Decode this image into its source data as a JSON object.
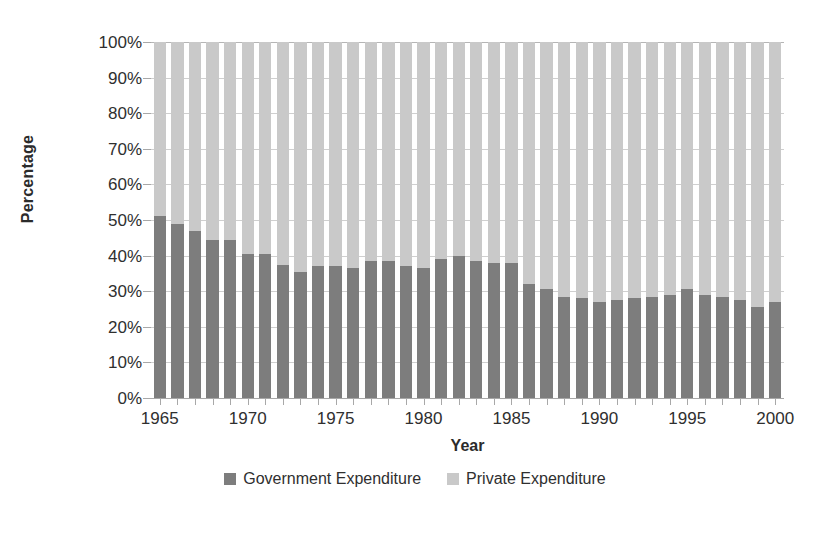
{
  "chart_data": {
    "type": "bar",
    "subtype": "stacked-100-percent",
    "title": "",
    "xlabel": "Year",
    "ylabel": "Percentage",
    "ylim": [
      0,
      100
    ],
    "y_ticks": [
      "0%",
      "10%",
      "20%",
      "30%",
      "40%",
      "50%",
      "60%",
      "70%",
      "80%",
      "90%",
      "100%"
    ],
    "y_tick_values": [
      0,
      10,
      20,
      30,
      40,
      50,
      60,
      70,
      80,
      90,
      100
    ],
    "x_tick_labels": [
      "1965",
      "1970",
      "1975",
      "1980",
      "1985",
      "1990",
      "1995",
      "2000"
    ],
    "x_tick_years": [
      1965,
      1970,
      1975,
      1980,
      1985,
      1990,
      1995,
      2000
    ],
    "grid": true,
    "legend_position": "bottom",
    "categories": [
      "1965",
      "1966",
      "1967",
      "1968",
      "1969",
      "1970",
      "1971",
      "1972",
      "1973",
      "1974",
      "1975",
      "1976",
      "1977",
      "1978",
      "1979",
      "1980",
      "1981",
      "1982",
      "1983",
      "1984",
      "1985",
      "1986",
      "1987",
      "1988",
      "1989",
      "1990",
      "1991",
      "1992",
      "1993",
      "1994",
      "1995",
      "1996",
      "1997",
      "1998",
      "1999",
      "2000"
    ],
    "series": [
      {
        "name": "Government Expenditure",
        "color": "#7d7d7d",
        "values": [
          51,
          49,
          47,
          44.5,
          44.5,
          40.5,
          40.5,
          37.5,
          35.5,
          37,
          37,
          36.5,
          38.5,
          38.5,
          37,
          36.5,
          39,
          40,
          38.5,
          38,
          38,
          32,
          30.5,
          28.5,
          28,
          27,
          27.5,
          28,
          28.5,
          29,
          30.5,
          29,
          28.5,
          27.5,
          25.5,
          27
        ]
      },
      {
        "name": "Private Expenditure",
        "color": "#c9c9c9",
        "values": [
          49,
          51,
          53,
          55.5,
          55.5,
          59.5,
          59.5,
          62.5,
          64.5,
          63,
          63,
          63.5,
          61.5,
          61.5,
          63,
          63.5,
          61,
          60,
          61.5,
          62,
          62,
          68,
          69.5,
          71.5,
          72,
          73,
          72.5,
          72,
          71.5,
          71,
          69.5,
          71,
          71.5,
          72.5,
          74.5,
          73
        ]
      }
    ]
  },
  "legend": {
    "entries": [
      {
        "label": "Government Expenditure",
        "color": "#7d7d7d"
      },
      {
        "label": "Private Expenditure",
        "color": "#c9c9c9"
      }
    ]
  },
  "axes": {
    "y_title": "Percentage",
    "x_title": "Year"
  }
}
